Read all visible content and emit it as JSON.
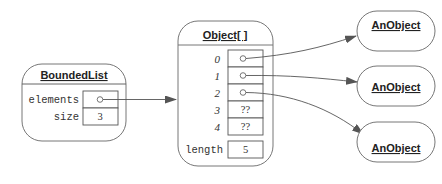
{
  "bounded_list": {
    "title": "BoundedList",
    "fields": [
      {
        "name": "elements",
        "value": "o",
        "is_reference": true
      },
      {
        "name": "size",
        "value": "3",
        "is_reference": false
      }
    ]
  },
  "array": {
    "title": "Object[ ]",
    "indices": [
      "0",
      "1",
      "2",
      "3",
      "4"
    ],
    "values": [
      "o",
      "o",
      "o",
      "??",
      "??"
    ],
    "length_label": "length",
    "length_value": "5"
  },
  "objects": [
    {
      "title": "AnObject"
    },
    {
      "title": "AnObject"
    },
    {
      "title": "AnObject"
    }
  ],
  "colors": {
    "stroke": "#777777",
    "arrow": "#555555",
    "text": "#222222"
  }
}
